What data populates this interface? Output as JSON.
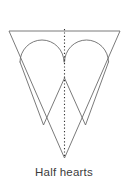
{
  "figure": {
    "caption": "Half hearts",
    "caption_color": "#3b3b3b",
    "background_color": "#ffffff",
    "stroke_color": "#6b6b6b",
    "centerline_color": "#333333"
  },
  "chart_data": {
    "type": "diagram",
    "title": "Half hearts",
    "canvas": {
      "width": 128,
      "height": 165
    },
    "shapes": [
      {
        "name": "outer-inverted-triangle",
        "kind": "polygon",
        "points": [
          [
            9,
            31
          ],
          [
            120,
            31
          ],
          [
            64.5,
            158
          ]
        ],
        "fill": "none",
        "stroke": "#6b6b6b",
        "stroke_width": 0.9
      },
      {
        "name": "left-heart-arc",
        "kind": "arc",
        "center": [
          42,
          62
        ],
        "radius": 22,
        "start_point": [
          20,
          62
        ],
        "end_point": [
          64,
          62
        ],
        "sweep": "upper-semicircle",
        "stroke": "#6b6b6b",
        "stroke_width": 0.9
      },
      {
        "name": "right-heart-arc",
        "kind": "arc",
        "center": [
          86.5,
          62
        ],
        "radius": 22,
        "start_point": [
          64.5,
          62
        ],
        "end_point": [
          108.5,
          62
        ],
        "sweep": "upper-semicircle",
        "stroke": "#6b6b6b",
        "stroke_width": 0.9
      },
      {
        "name": "left-heart-v",
        "kind": "polyline",
        "points": [
          [
            20,
            62
          ],
          [
            43.5,
            125
          ],
          [
            64.5,
            78
          ]
        ],
        "stroke": "#6b6b6b",
        "stroke_width": 0.9
      },
      {
        "name": "right-heart-v",
        "kind": "polyline",
        "points": [
          [
            108.5,
            62
          ],
          [
            85.5,
            125
          ],
          [
            64.5,
            78
          ]
        ],
        "stroke": "#6b6b6b",
        "stroke_width": 0.9
      },
      {
        "name": "center-fold-line",
        "kind": "dotted-line",
        "points": [
          [
            64.5,
            29
          ],
          [
            64.5,
            158
          ]
        ],
        "stroke": "#333333",
        "stroke_width": 1.1,
        "dash": "1.2 2.2"
      }
    ],
    "labels": [
      {
        "name": "caption",
        "text": "Half hearts",
        "x": 64,
        "y": 176,
        "anchor": "middle"
      }
    ]
  }
}
